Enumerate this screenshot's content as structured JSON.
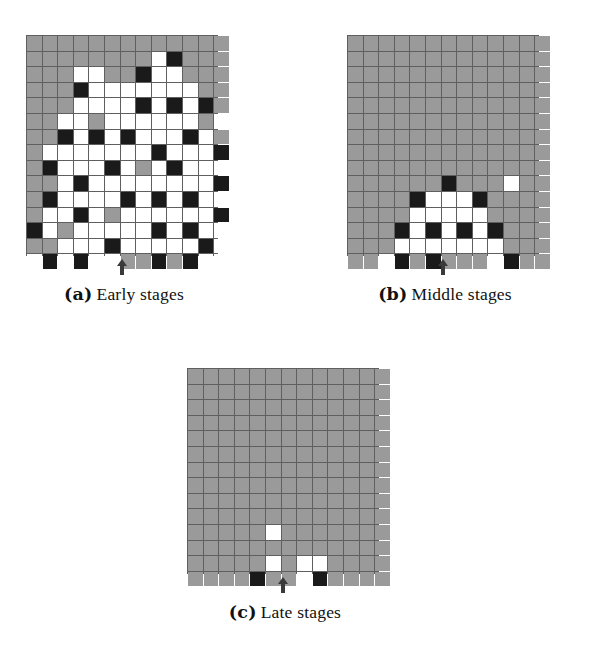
{
  "figure": {
    "background_color": "#ffffff",
    "cell_colors": {
      "gray": "#9a9a9a",
      "white": "#ffffff",
      "black": "#1a1a1a",
      "gridline": "#5f5f5f"
    },
    "legend_keys": {
      "g": "gray",
      "w": "white",
      "b": "black"
    },
    "grid_columns": 13,
    "grid_rows": 14,
    "arrow_icon_name": "up-arrow-marker",
    "panels": [
      {
        "id": "a",
        "tag": "(a)",
        "caption": "Early stages",
        "arrow_column_index": 6,
        "cells": [
          "ggggggggggggg",
          "ggggggggwbggg",
          "gggwwggbwwggg",
          "gggbwwwwwwwgg",
          "gggwwwwbwbwbg",
          "ggwwgwwwwwwgw",
          "ggbwbwbwwwbwg",
          "gwwwwwwwbwwwb",
          "gbwwwbwgwbwww",
          "ggwbwwwwwwwwb",
          "gbwwwwbwbwbww",
          "gwwbwgwwwwwwb",
          "bwgwwwwwbwbww",
          "ggwwwbwwwwwbw",
          "wbwbwwggbgbww"
        ]
      },
      {
        "id": "b",
        "tag": "(b)",
        "caption": "Middle stages",
        "arrow_column_index": 6,
        "cells": [
          "ggggggggggggg",
          "ggggggggggggg",
          "ggggggggggggg",
          "ggggggggggggg",
          "ggggggggggggg",
          "ggggggggggggg",
          "ggggggggggggg",
          "ggggggggggggg",
          "ggggggggggggg",
          "ggggggbgggwgg",
          "ggggbwwwbgggg",
          "ggggwwwwwgggg",
          "gggbwbwbwbggg",
          "gggwwwwwwwggg",
          "ggwbgbgggwbgg"
        ]
      },
      {
        "id": "c",
        "tag": "(c)",
        "caption": "Late stages",
        "arrow_column_index": 6,
        "cells": [
          "ggggggggggggg",
          "ggggggggggggg",
          "ggggggggggggg",
          "ggggggggggggg",
          "ggggggggggggg",
          "ggggggggggggg",
          "ggggggggggggg",
          "ggggggggggggg",
          "ggggggggggggg",
          "ggggggggggggg",
          "gggggwggggggg",
          "ggggggggggggg",
          "gggggwgwwgggg",
          "ggggbggwbgggg"
        ]
      }
    ]
  }
}
